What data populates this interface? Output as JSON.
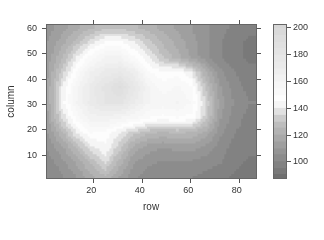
{
  "chart_data": {
    "type": "heatmap",
    "title": "",
    "xlabel": "row",
    "ylabel": "column",
    "xlim": [
      0.5,
      87.5
    ],
    "ylim": [
      0.5,
      61.5
    ],
    "x_ticks": [
      20,
      40,
      60,
      80
    ],
    "y_ticks": [
      10,
      20,
      30,
      40,
      50,
      60
    ],
    "colorbar": {
      "range": [
        87,
        202
      ],
      "ticks": [
        100,
        120,
        140,
        160,
        180,
        200
      ],
      "palette": [
        {
          "value": 87,
          "color": "#6e6e6e"
        },
        {
          "value": 110,
          "color": "#9a9a9a"
        },
        {
          "value": 130,
          "color": "#c2c2c2"
        },
        {
          "value": 145,
          "color": "#ffffff"
        },
        {
          "value": 170,
          "color": "#ececec"
        },
        {
          "value": 202,
          "color": "#d6d6d6"
        }
      ]
    },
    "grid_x": [
      1,
      7,
      13,
      19,
      25,
      31,
      37,
      43,
      49,
      55,
      61,
      67,
      73,
      79,
      85
    ],
    "grid_y": [
      61,
      55,
      49,
      43,
      37,
      31,
      25,
      19,
      13,
      7,
      1
    ],
    "values": [
      [
        108,
        112,
        118,
        124,
        128,
        128,
        126,
        122,
        118,
        114,
        110,
        106,
        102,
        98,
        96
      ],
      [
        110,
        118,
        128,
        138,
        146,
        146,
        140,
        132,
        124,
        118,
        112,
        106,
        100,
        96,
        94
      ],
      [
        112,
        124,
        140,
        152,
        160,
        160,
        150,
        140,
        130,
        122,
        114,
        106,
        100,
        96,
        94
      ],
      [
        114,
        132,
        150,
        165,
        172,
        175,
        168,
        150,
        146,
        148,
        140,
        120,
        106,
        100,
        96
      ],
      [
        116,
        140,
        158,
        172,
        182,
        190,
        176,
        160,
        152,
        156,
        150,
        128,
        110,
        102,
        98
      ],
      [
        116,
        142,
        160,
        172,
        180,
        182,
        170,
        160,
        158,
        160,
        154,
        134,
        112,
        104,
        100
      ],
      [
        114,
        136,
        152,
        162,
        164,
        160,
        156,
        150,
        148,
        150,
        148,
        132,
        110,
        102,
        98
      ],
      [
        110,
        124,
        140,
        150,
        148,
        140,
        132,
        126,
        124,
        126,
        124,
        118,
        106,
        100,
        98
      ],
      [
        106,
        114,
        126,
        138,
        144,
        132,
        118,
        112,
        110,
        112,
        112,
        108,
        102,
        98,
        96
      ],
      [
        102,
        108,
        116,
        126,
        136,
        122,
        110,
        106,
        104,
        104,
        104,
        102,
        100,
        96,
        94
      ],
      [
        100,
        104,
        110,
        118,
        124,
        114,
        106,
        102,
        100,
        100,
        100,
        98,
        96,
        94,
        94
      ]
    ]
  }
}
